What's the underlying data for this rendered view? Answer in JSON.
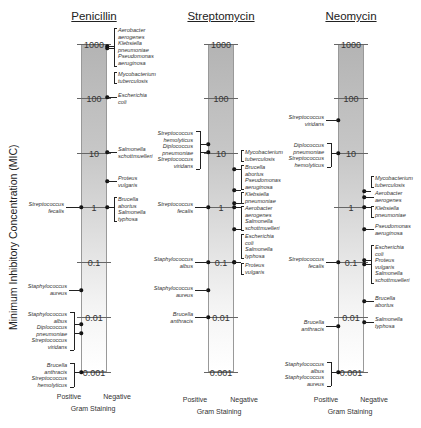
{
  "chart_data": {
    "type": "scatter",
    "ylabel": "Minimum Inhibitory Concentration (MIC)",
    "xlabel": "Gram Staining",
    "yscale": "log",
    "ylim": [
      0.001,
      1000
    ],
    "yticks": [
      "1000",
      "100",
      "10",
      "1",
      "0.1",
      "0.01",
      "0.001"
    ],
    "x_categories": [
      "Positive",
      "Negative"
    ],
    "panels": [
      {
        "name": "Penicillin",
        "positive": [
          {
            "bacteria": [
              "Streptococcus fecalis"
            ],
            "mic": 1
          },
          {
            "bacteria": [
              "Staphylococcus aureus"
            ],
            "mic": 0.03
          },
          {
            "bacteria": [
              "Staphylococcus albus"
            ],
            "mic": 0.007
          },
          {
            "bacteria": [
              "Diplococcus pneumoniae",
              "Streptococcus viridans"
            ],
            "mic": 0.005
          },
          {
            "bacteria": [
              "Brucella anthracis",
              "Streptococcus hemolyticus"
            ],
            "mic": 0.001
          }
        ],
        "negative": [
          {
            "bacteria": [
              "Aerobacter aerogenes",
              "Klebsiella pneumoniae",
              "Pseudomonas aeruginosa"
            ],
            "mic": 850
          },
          {
            "bacteria": [
              "Mycobacterium tuberculosis"
            ],
            "mic": 800
          },
          {
            "bacteria": [
              "Escherichia coli"
            ],
            "mic": 100
          },
          {
            "bacteria": [
              "Salmonella schottmuelleri"
            ],
            "mic": 10
          },
          {
            "bacteria": [
              "Proteus vulgaris"
            ],
            "mic": 3
          },
          {
            "bacteria": [
              "Brucella abortus",
              "Salmonella typhosa"
            ],
            "mic": 1
          }
        ]
      },
      {
        "name": "Streptomycin",
        "positive": [
          {
            "bacteria": [
              "Streptococcus hemolyticus"
            ],
            "mic": 14
          },
          {
            "bacteria": [
              "Diplococcus pneumoniae",
              "Streptococcus viridans"
            ],
            "mic": 11
          },
          {
            "bacteria": [
              "Streptococcus fecalis"
            ],
            "mic": 1
          },
          {
            "bacteria": [
              "Staphylococcus albus"
            ],
            "mic": 0.1
          },
          {
            "bacteria": [
              "Staphylococcus aureus"
            ],
            "mic": 0.03
          },
          {
            "bacteria": [
              "Brucella anthracis"
            ],
            "mic": 0.01
          }
        ],
        "negative": [
          {
            "bacteria": [
              "Mycobacterium tuberculosis"
            ],
            "mic": 5
          },
          {
            "bacteria": [
              "Brucella abortus",
              "Pseudomonas aeruginosa"
            ],
            "mic": 2
          },
          {
            "bacteria": [
              "Klebsiella pneumoniae"
            ],
            "mic": 1.2
          },
          {
            "bacteria": [
              "Aerobacter aerogenes"
            ],
            "mic": 1
          },
          {
            "bacteria": [
              "Salmonella schottmuelleri"
            ],
            "mic": 0.4
          },
          {
            "bacteria": [
              "Escherichia coli",
              "Salmonella typhosa"
            ],
            "mic": 0.1
          },
          {
            "bacteria": [
              "Proteus vulgaris"
            ],
            "mic": 0.1
          }
        ]
      },
      {
        "name": "Neomycin",
        "positive": [
          {
            "bacteria": [
              "Streptococcus viridans"
            ],
            "mic": 40
          },
          {
            "bacteria": [
              "Diplococcus pneumoniae",
              "Streptococcus hemolyticus"
            ],
            "mic": 10
          },
          {
            "bacteria": [
              "Streptococcus fecalis"
            ],
            "mic": 0.1
          },
          {
            "bacteria": [
              "Brucella anthracis"
            ],
            "mic": 0.007
          },
          {
            "bacteria": [
              "Staphylococcus albus",
              "Staphylococcus aureus"
            ],
            "mic": 0.001
          }
        ],
        "negative": [
          {
            "bacteria": [
              "Mycobacterium tuberculosis"
            ],
            "mic": 2
          },
          {
            "bacteria": [
              "Aerobacter aerogenes"
            ],
            "mic": 1.5
          },
          {
            "bacteria": [
              "Klebsiella pneumoniae"
            ],
            "mic": 1
          },
          {
            "bacteria": [
              "Pseudomonas aeruginosa"
            ],
            "mic": 0.4
          },
          {
            "bacteria": [
              "Escherichia coli",
              "Proteus vulgaris",
              "Salmonella schottmuelleri"
            ],
            "mic": 0.1
          },
          {
            "bacteria": [
              "Brucella abortus"
            ],
            "mic": 0.02
          },
          {
            "bacteria": [
              "Salmonella typhosa"
            ],
            "mic": 0.009
          }
        ]
      }
    ],
    "grid": false,
    "legend": null
  },
  "labels": {
    "ylabel": "Minimum Inhibitory Concentration (MIC)",
    "positive": "Positive",
    "negative": "Negative",
    "gram_staining": "Gram Staining",
    "ticks": [
      "1000",
      "100",
      "10",
      "1",
      "0.1",
      "0.01",
      "0.001"
    ],
    "panels": [
      "Penicillin",
      "Streptomycin",
      "Neomycin"
    ]
  },
  "texts": {
    "pen_pos": [
      [
        "Streptococcus",
        "fecalis"
      ],
      [
        "Staphylococcus",
        "aureus"
      ],
      [
        "Staphylococcus",
        "albus",
        "Diplococcus",
        "pneumoniae",
        "Streptococcus",
        "viridans"
      ],
      [
        "Brucella",
        "anthracis",
        "Streptococcus",
        "hemolyticus"
      ]
    ],
    "pen_neg": [
      [
        "Aerobacter",
        "aerogenes",
        "Klebsiella",
        "pneumoniae",
        "Pseudomonas",
        "aeruginosa"
      ],
      [
        "Mycobacterium",
        "tuberculosis"
      ],
      [
        "Escherichia",
        "coli"
      ],
      [
        "Salmonella",
        "schottmuelleri"
      ],
      [
        "Proteus",
        "vulgaris"
      ],
      [
        "Brucella",
        "abortus",
        "Salmonella",
        "typhosa"
      ]
    ],
    "str_pos": [
      [
        "Streptococcus",
        "hemolyticus",
        "Diplococcus",
        "pneumoniae",
        "Streptococcus",
        "viridans"
      ],
      [
        "Streptococcus",
        "fecalis"
      ],
      [
        "Staphylococcus",
        "albus"
      ],
      [
        "Staphylococcus",
        "aureus"
      ],
      [
        "Brucella",
        "anthracis"
      ]
    ],
    "str_neg": [
      [
        "Mycobacterium",
        "tuberculosis"
      ],
      [
        "Brucella",
        "abortus",
        "Pseudomonas",
        "aeruginosa"
      ],
      [
        "Klebsiella",
        "pneumoniae"
      ],
      [
        "Aerobacter",
        "aerogenes",
        "Salmonella",
        "schottmuelleri"
      ],
      [
        "Escherichia",
        "coli",
        "Salmonella",
        "typhosa"
      ],
      [
        "Proteus",
        "vulgaris"
      ]
    ],
    "neo_pos": [
      [
        "Streptococcus",
        "viridans"
      ],
      [
        "Diplococcus",
        "pneumoniae",
        "Streptococcus",
        "hemolyticus"
      ],
      [
        "Streptococcus",
        "fecalis"
      ],
      [
        "Brucella",
        "anthracis"
      ],
      [
        "Staphylococcus",
        "albus",
        "Staphylococcus",
        "aureus"
      ]
    ],
    "neo_neg": [
      [
        "Mycobacterium",
        "tuberculosis"
      ],
      [
        "Aerobacter",
        "aerogenes"
      ],
      [
        "Klebsiella",
        "pneumoniae"
      ],
      [
        "Pseudomonas",
        "aeruginosa"
      ],
      [
        "Escherichia",
        "coli",
        "Proteus",
        "vulgaris",
        "Salmonella",
        "schottmuelleri"
      ],
      [
        "Brucella",
        "abortus"
      ],
      [
        "Salmonella",
        "typhosa"
      ]
    ]
  }
}
